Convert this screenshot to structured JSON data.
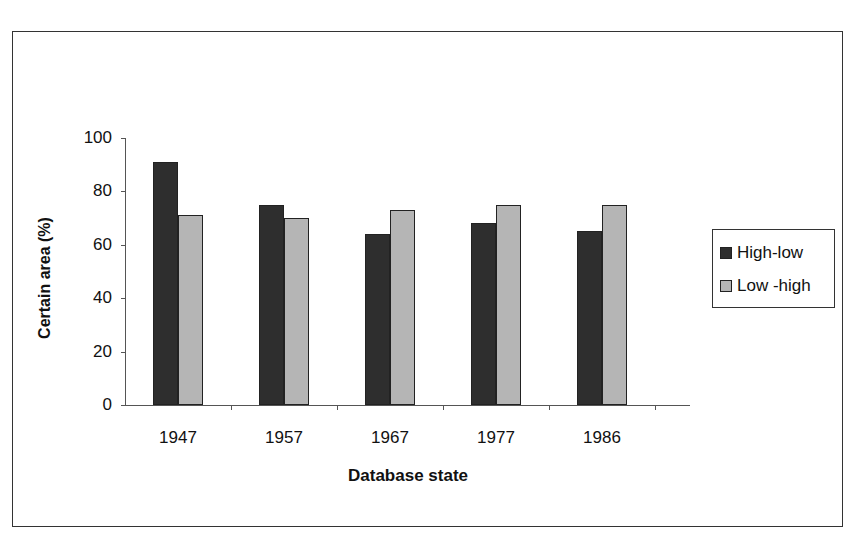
{
  "chart_data": {
    "type": "bar",
    "title": "",
    "xlabel": "Database state",
    "ylabel": "Certain area (%)",
    "ylim": [
      0,
      100
    ],
    "yticks": [
      0,
      20,
      40,
      60,
      80,
      100
    ],
    "grid": false,
    "legend_position": "right",
    "categories": [
      "1947",
      "1957",
      "1967",
      "1977",
      "1986"
    ],
    "series": [
      {
        "name": "High-low",
        "color": "#2e2e2e",
        "values": [
          91,
          75,
          64,
          68,
          65
        ]
      },
      {
        "name": "Low -high",
        "color": "#b5b5b5",
        "values": [
          71,
          70,
          73,
          75,
          75
        ]
      }
    ]
  },
  "axes": {
    "y_ticks": [
      "0",
      "20",
      "40",
      "60",
      "80",
      "100"
    ],
    "x_ticks": [
      "1947",
      "1957",
      "1967",
      "1977",
      "1986"
    ],
    "x_title": "Database state",
    "y_title": "Certain area (%)"
  },
  "legend": {
    "items": [
      {
        "label": "High-low"
      },
      {
        "label": "Low -high"
      }
    ]
  }
}
